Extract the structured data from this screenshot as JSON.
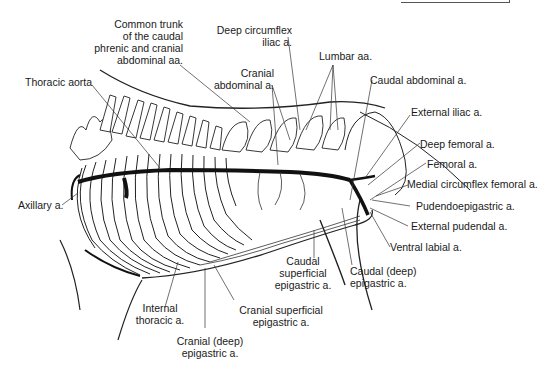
{
  "figure": {
    "labels": {
      "common_trunk": [
        "Common trunk",
        "of the caudal",
        "phrenic and cranial",
        "abdominal aa."
      ],
      "thoracic_aorta": "Thoracic aorta",
      "deep_circumflex_iliac": [
        "Deep circumflex",
        "iliac a."
      ],
      "cranial_abdominal": [
        "Cranial",
        "abdominal a."
      ],
      "lumbar": "Lumbar aa.",
      "caudal_abdominal": "Caudal abdominal a.",
      "external_iliac": "External iliac a.",
      "deep_femoral": "Deep femoral a.",
      "femoral": "Femoral a.",
      "medial_circumflex_femoral": "Medial circumflex femoral a.",
      "pudendoepigastric": "Pudendoepigastric a.",
      "external_pudendal": "External pudendal a.",
      "ventral_labial": "Ventral labial a.",
      "axillary": "Axillary a.",
      "caudal_superficial_epigastric": [
        "Caudal",
        "superficial",
        "epigastric a."
      ],
      "caudal_deep_epigastric": [
        "Caudal (deep)",
        "epigastric a."
      ],
      "internal_thoracic": [
        "Internal",
        "thoracic a."
      ],
      "cranial_superficial_epigastric": [
        "Cranial superficial",
        "epigastric a."
      ],
      "cranial_deep_epigastric": [
        "Cranial (deep)",
        "epigastric a."
      ]
    }
  }
}
